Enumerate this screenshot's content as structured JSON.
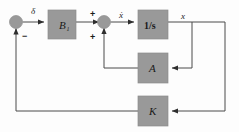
{
  "diagram": {
    "colors": {
      "block_fill": "#999999",
      "block_stroke": "#8c8c8c",
      "wire": "#4a4a4a",
      "text": "#1a1a1a",
      "background": "#fdfdfd"
    },
    "blocks": [
      {
        "id": "b1",
        "label": "B",
        "subscript": "1",
        "x": 48,
        "y": 10,
        "w": 28,
        "h": 29
      },
      {
        "id": "integrator",
        "label": "1/s",
        "subscript": "",
        "x": 138,
        "y": 10,
        "w": 30,
        "h": 29
      },
      {
        "id": "a",
        "label": "A",
        "subscript": "",
        "x": 138,
        "y": 53,
        "w": 30,
        "h": 30
      },
      {
        "id": "k",
        "label": "K",
        "subscript": "",
        "x": 138,
        "y": 96,
        "w": 30,
        "h": 30
      }
    ],
    "summing_junctions": [
      {
        "id": "sum-left",
        "cx": 16,
        "cy": 22,
        "r": 6.5
      },
      {
        "id": "sum-mid",
        "cx": 104,
        "cy": 22,
        "r": 6.5
      }
    ],
    "signals": [
      {
        "id": "input-delta",
        "label": "δ",
        "x": 31,
        "y": 12
      },
      {
        "id": "xdot",
        "label": "ẋ",
        "x": 120,
        "y": 16
      },
      {
        "id": "x-output",
        "label": "x",
        "x": 181,
        "y": 18
      }
    ],
    "signs": [
      {
        "id": "sum-left-minus",
        "label": "−",
        "x": 23,
        "y": 37
      },
      {
        "id": "sum-mid-plus-top",
        "label": "+",
        "x": 90,
        "y": 15
      },
      {
        "id": "sum-mid-plus-bottom",
        "label": "+",
        "x": 90,
        "y": 38
      }
    ],
    "connections": [
      "delta-input to sum-left",
      "sum-left to B1",
      "B1 to sum-mid",
      "sum-mid to integrator",
      "integrator to x output node",
      "x node down to A block input",
      "A block output left and up to sum-mid",
      "x node far right down to K block input",
      "K block output left to sum-left"
    ]
  }
}
